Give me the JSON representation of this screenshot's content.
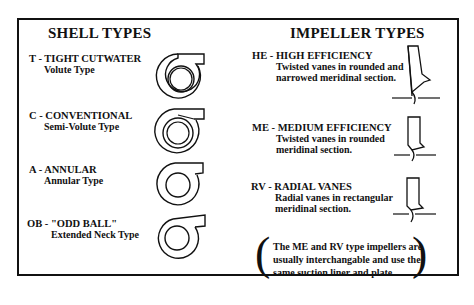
{
  "shell": {
    "title": "SHELL TYPES",
    "items": [
      {
        "code": "T - TIGHT CUTWATER",
        "desc": "Volute Type",
        "icon": "volute-shell-icon"
      },
      {
        "code": "C - CONVENTIONAL",
        "desc": "Semi-Volute Type",
        "icon": "semi-volute-shell-icon"
      },
      {
        "code": "A - ANNULAR",
        "desc": "Annular Type",
        "icon": "annular-shell-icon"
      },
      {
        "code": "OB - \"ODD BALL\"",
        "desc": "Extended Neck Type",
        "icon": "extended-neck-shell-icon"
      }
    ]
  },
  "impeller": {
    "title": "IMPELLER TYPES",
    "items": [
      {
        "code": "HE - HIGH EFFICIENCY",
        "desc1": "Twisted vanes in rounded and",
        "desc2": "narrowed meridinal section.",
        "icon": "high-efficiency-impeller-icon"
      },
      {
        "code": "ME - MEDIUM EFFICIENCY",
        "desc1": "Twisted vanes in rounded",
        "desc2": "meridinal section.",
        "icon": "medium-efficiency-impeller-icon"
      },
      {
        "code": "RV - RADIAL VANES",
        "desc1": "Radial vanes in rectangular",
        "desc2": "meridinal section.",
        "icon": "radial-vane-impeller-icon"
      }
    ],
    "note": {
      "open": "(",
      "close": ")",
      "line1": "The ME and RV type impellers are",
      "line2": "usually interchangable and use the",
      "line3": "same suction liner and plate"
    }
  }
}
